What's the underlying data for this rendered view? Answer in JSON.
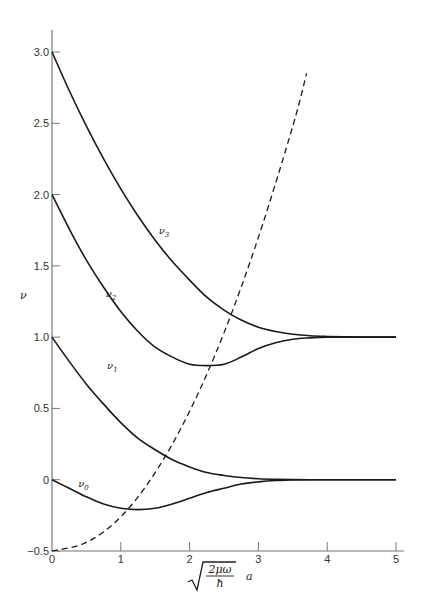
{
  "chart_data": {
    "type": "line",
    "title": "",
    "xlabel": "√(2μω/ħ) a",
    "xlabel_parts": {
      "numerator": "2μω",
      "denominator": "ħ",
      "suffix": "a"
    },
    "ylabel": "ν",
    "xlim": [
      0,
      5
    ],
    "ylim": [
      -0.5,
      3.0
    ],
    "grid": false,
    "legend": "none (inline curve labels)",
    "x_ticks": [
      "0",
      "1",
      "2",
      "3",
      "4",
      "5"
    ],
    "y_ticks": [
      "−0.5",
      "0",
      "0.5",
      "1.0",
      "1.5",
      "2.0",
      "2.5",
      "3.0"
    ],
    "x": [
      0,
      0.25,
      0.5,
      0.75,
      1.0,
      1.25,
      1.5,
      1.75,
      2.0,
      2.25,
      2.5,
      2.75,
      3.0,
      3.25,
      3.5,
      3.75,
      4.0,
      4.25,
      4.5,
      4.75,
      5.0
    ],
    "series": [
      {
        "name": "ν3",
        "label": "ν",
        "subscript": "3",
        "style": "solid",
        "label_pos": [
          1.55,
          1.72
        ],
        "values": [
          3.0,
          2.73,
          2.48,
          2.25,
          2.04,
          1.85,
          1.68,
          1.53,
          1.4,
          1.28,
          1.19,
          1.12,
          1.07,
          1.04,
          1.02,
          1.01,
          1.005,
          1.002,
          1.0,
          1.0,
          1.0
        ]
      },
      {
        "name": "ν2",
        "label": "ν",
        "subscript": "2",
        "style": "solid",
        "label_pos": [
          0.78,
          1.28
        ],
        "values": [
          2.0,
          1.76,
          1.54,
          1.35,
          1.18,
          1.04,
          0.93,
          0.86,
          0.81,
          0.8,
          0.81,
          0.86,
          0.92,
          0.96,
          0.985,
          0.995,
          1.0,
          1.0,
          1.0,
          1.0,
          1.0
        ]
      },
      {
        "name": "ν1",
        "label": "ν",
        "subscript": "1",
        "style": "solid",
        "label_pos": [
          0.8,
          0.78
        ],
        "values": [
          1.0,
          0.83,
          0.67,
          0.53,
          0.4,
          0.29,
          0.21,
          0.14,
          0.09,
          0.05,
          0.03,
          0.015,
          0.007,
          0.003,
          0.001,
          0.0,
          0.0,
          0.0,
          0.0,
          0.0,
          0.0
        ]
      },
      {
        "name": "ν0",
        "label": "ν",
        "subscript": "0",
        "style": "solid",
        "label_pos": [
          0.38,
          -0.05
        ],
        "values": [
          0.0,
          -0.06,
          -0.12,
          -0.17,
          -0.2,
          -0.21,
          -0.2,
          -0.17,
          -0.13,
          -0.09,
          -0.06,
          -0.03,
          -0.015,
          -0.006,
          -0.002,
          0.0,
          0.0,
          0.0,
          0.0,
          0.0,
          0.0
        ]
      },
      {
        "name": "boundary",
        "label": "",
        "style": "dashed",
        "x": [
          0,
          0.5,
          1.0,
          1.5,
          2.0,
          2.5,
          3.0,
          3.5,
          3.7
        ],
        "values": [
          -0.5,
          -0.44,
          -0.26,
          0.05,
          0.48,
          1.03,
          1.7,
          2.48,
          2.85
        ]
      }
    ]
  }
}
